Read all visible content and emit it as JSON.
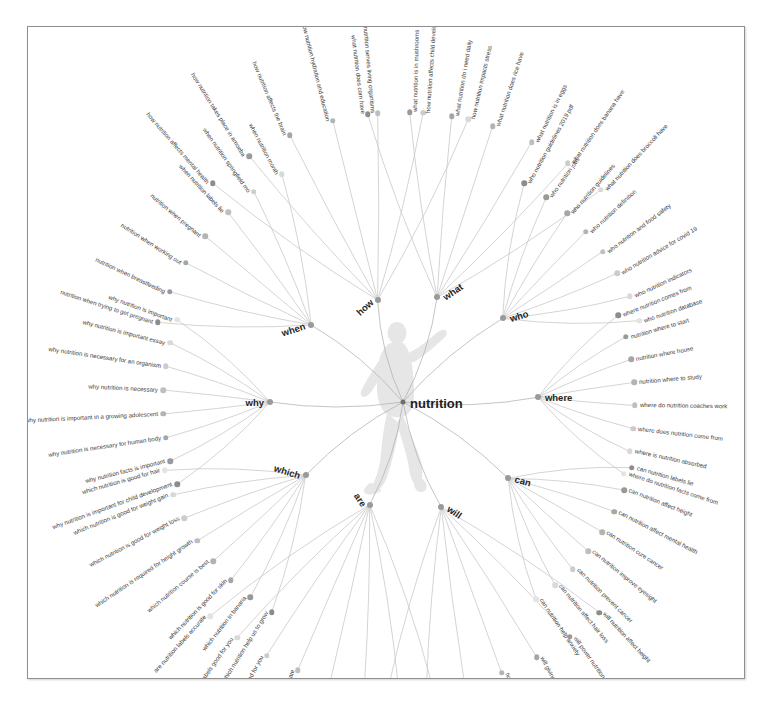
{
  "top_strip": {
    "text": "·· ···· ·· ··· ·· ····· ···  ·· ·· ····  ·· ··"
  },
  "graph": {
    "center": {
      "label": "nutrition"
    },
    "watermark": "human-silhouette",
    "colors": {
      "node_dark": "#8c8c8c",
      "node_light": "#e2e2e2",
      "link": "#c9c9c9",
      "text": "#3c3c3c",
      "hub_text": "#262626",
      "card_border": "#8f8f8f",
      "background": "#ffffff"
    },
    "branches": [
      {
        "id": "how",
        "label": "how",
        "children": [
          "how nutrition affects mental health",
          "how nutrition takes place in amoeba",
          "how nutrition affects the brain",
          "how nutrition hydration and education",
          "how nutrition serves living organisms",
          "how nutrition affects child development",
          "how nutrition impacts stress"
        ]
      },
      {
        "id": "what",
        "label": "what",
        "children": [
          "what nutrition does corn have",
          "what nutrition is in mushrooms",
          "what nutrition do i need daily",
          "what nutrition does rice have",
          "what nutrition is in eggs",
          "what nutrition does banana have",
          "what nutrition does broccoli have"
        ]
      },
      {
        "id": "who",
        "label": "who",
        "children": [
          "who nutrition guidelines 2019 pdf",
          "who nutrition jobs",
          "who nutrition guidelines",
          "who nutrition definition",
          "who nutrition and food safety",
          "who nutrition advice for covid 19",
          "who nutrition indicators",
          "who nutrition database"
        ]
      },
      {
        "id": "where",
        "label": "where",
        "children": [
          "where nutrition comes from",
          "nutrition where to start",
          "nutrition where house",
          "nutrition where to study",
          "where do nutrition coaches work",
          "where does nutrition come from",
          "where is nutrition absorbed",
          "where do nutrition facts come from"
        ]
      },
      {
        "id": "can",
        "label": "can",
        "children": [
          "can nutrition labels lie",
          "can nutrition affect height",
          "can nutrition affect mental health",
          "can nutrition cure cancer",
          "can nutrition improve eyesight",
          "can nutrition prevent cancer",
          "can nutrition affect hair loss",
          "can nutrition help anxiety"
        ]
      },
      {
        "id": "will",
        "label": "will",
        "children": [
          "will nutrition affect height",
          "will power nutrition",
          "will giving nutrition",
          "how will nutrition help you as a student",
          "will sports nutrition",
          "will cote nutrition",
          "will poor nutrition stunt growth"
        ]
      },
      {
        "id": "are",
        "label": "are",
        "children": [
          "are nutrition labels regulated",
          "are nutrition drinks good for you",
          "are nutrition facts per serving",
          "are nutrition bars healthy",
          "are nutrition facts accurate",
          "are nutrition shakes good for you",
          "are nutrition labels good for you",
          "are nutrition labels accurate"
        ]
      },
      {
        "id": "which",
        "label": "which",
        "children": [
          "which nutrition help us to grow",
          "which nutrition in banana",
          "which nutrition is good for skin",
          "which nutrition course is best",
          "which nutrition is required for height growth",
          "which nutrition is good for weight loss",
          "which nutrition is good for weight gain",
          "which nutrition is good for hair"
        ]
      },
      {
        "id": "why",
        "label": "why",
        "children": [
          "why nutrition is important for child development",
          "why nutrition facts is important",
          "why nutrition is necessary for human body",
          "why nutrition is important in a growing adolescent",
          "why nutrition is necessary",
          "why nutrition is necessary for an organism",
          "why nutrition is important essay",
          "why nutrition is important"
        ]
      },
      {
        "id": "when",
        "label": "when",
        "children": [
          "nutrition when trying to get pregnant",
          "nutrition when breastfeeding",
          "nutrition when working out",
          "nutrition when pregnant",
          "when nutrition labels lie",
          "when nutrition springfield mo",
          "when nutrition month"
        ]
      }
    ]
  }
}
